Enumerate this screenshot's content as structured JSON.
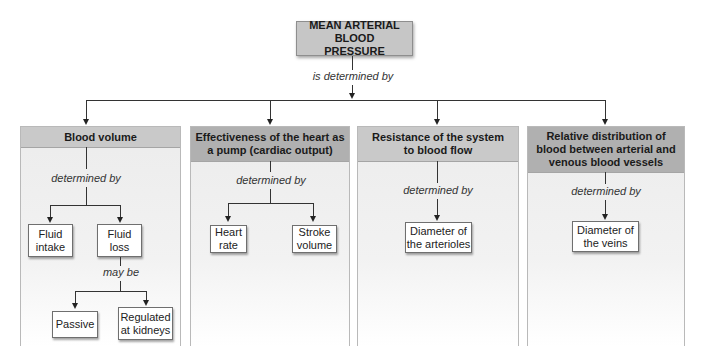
{
  "title": "MEAN ARTERIAL BLOOD PRESSURE",
  "top_connector_label": "is determined by",
  "panels": [
    {
      "header": "Blood volume",
      "connector_label": "determined by",
      "children": [
        "Fluid intake",
        "Fluid loss"
      ],
      "sub_connector_label": "may be",
      "sub_children": [
        "Passive",
        "Regulated at kidneys"
      ]
    },
    {
      "header": "Effectiveness of the heart as a pump (cardiac output)",
      "connector_label": "determined by",
      "children": [
        "Heart rate",
        "Stroke volume"
      ]
    },
    {
      "header": "Resistance of the system to blood flow",
      "connector_label": "determined by",
      "children": [
        "Diameter of the arterioles"
      ]
    },
    {
      "header": "Relative distribution of blood between arterial and venous blood vessels",
      "connector_label": "determined by",
      "children": [
        "Diameter of the veins"
      ]
    }
  ],
  "colors": {
    "top_box": "#c6c6c6",
    "header_light": "#c9c9c9",
    "header_dark": "#b0b0b0",
    "panel_bg": "#ececec",
    "line": "#333333"
  }
}
